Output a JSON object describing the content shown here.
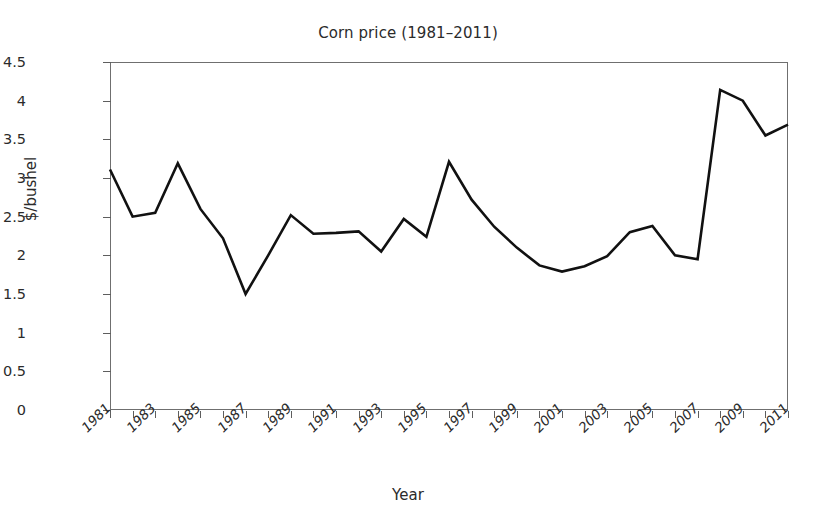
{
  "chart_data": {
    "type": "line",
    "title": "Corn price (1981–2011)",
    "xlabel": "Year",
    "ylabel": "$/bushel",
    "grid": false,
    "legend": null,
    "xlim": [
      1981,
      2011
    ],
    "ylim": [
      0,
      4.5
    ],
    "ytick_labels": [
      "0",
      "0.5",
      "1",
      "1.5",
      "2",
      "2.5",
      "3",
      "3.5",
      "4",
      "4.5"
    ],
    "ytick_values": [
      0,
      0.5,
      1,
      1.5,
      2,
      2.5,
      3,
      3.5,
      4,
      4.5
    ],
    "xtick_values": [
      1981,
      1982,
      1983,
      1984,
      1985,
      1986,
      1987,
      1988,
      1989,
      1990,
      1991,
      1992,
      1993,
      1994,
      1995,
      1996,
      1997,
      1998,
      1999,
      2000,
      2001,
      2002,
      2003,
      2004,
      2005,
      2006,
      2007,
      2008,
      2009,
      2010,
      2011
    ],
    "xtick_labels_shown": [
      "1981",
      "1983",
      "1985",
      "1987",
      "1989",
      "1991",
      "1993",
      "1995",
      "1997",
      "1999",
      "2001",
      "2003",
      "2005",
      "2007",
      "2009",
      "2011"
    ],
    "x": [
      1981,
      1982,
      1983,
      1984,
      1985,
      1986,
      1987,
      1988,
      1989,
      1990,
      1991,
      1992,
      1993,
      1994,
      1995,
      1996,
      1997,
      1998,
      1999,
      2000,
      2001,
      2002,
      2003,
      2004,
      2005,
      2006,
      2007,
      2008,
      2009,
      2010,
      2011
    ],
    "values": [
      3.11,
      2.5,
      2.55,
      3.19,
      2.6,
      2.22,
      1.5,
      2.0,
      2.52,
      2.28,
      2.29,
      2.31,
      2.05,
      2.47,
      2.24,
      3.21,
      2.72,
      2.37,
      2.1,
      1.87,
      1.79,
      1.86,
      1.99,
      2.3,
      2.38,
      2.0,
      1.95,
      4.14,
      4.0,
      3.55,
      3.69
    ],
    "series_color": "#111111",
    "frame_color": "#6f6f6f",
    "background": "#ffffff"
  }
}
